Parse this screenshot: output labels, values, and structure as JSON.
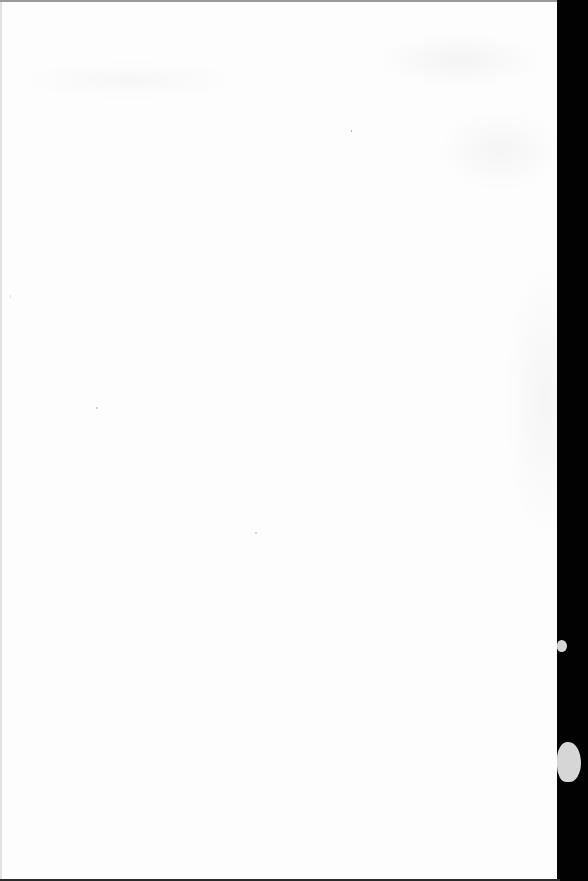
{
  "document": {
    "type": "blank-scanned-page",
    "text_content": "",
    "paper_color": "#fdfdfd",
    "background_edge_color": "#020202"
  }
}
